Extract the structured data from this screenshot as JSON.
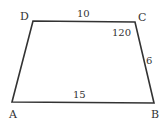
{
  "figure": {
    "type": "trapezoid",
    "vertices": {
      "A": {
        "label": "A",
        "x": 12,
        "y": 102
      },
      "B": {
        "label": "B",
        "x": 154,
        "y": 103
      },
      "C": {
        "label": "C",
        "x": 135,
        "y": 22
      },
      "D": {
        "label": "D",
        "x": 33,
        "y": 21
      }
    },
    "sides": {
      "DC": "10",
      "AB": "15",
      "CB": "6"
    },
    "angles": {
      "C": "120"
    },
    "stroke_color": "#333333"
  }
}
